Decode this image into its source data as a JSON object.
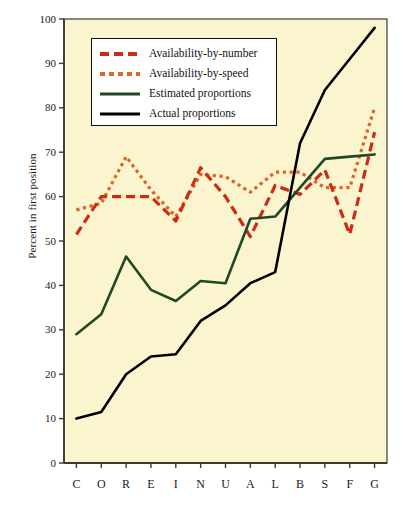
{
  "chart_data": {
    "type": "line",
    "title": "",
    "subtitle": "",
    "xlabel": "",
    "ylabel": "Percent in first position",
    "ylim": [
      0,
      100
    ],
    "ytick_labels": [
      "100",
      "90",
      "80",
      "70",
      "60",
      "50",
      "40",
      "30",
      "20",
      "10",
      "0"
    ],
    "ytick_values": [
      100,
      90,
      80,
      70,
      60,
      50,
      40,
      30,
      20,
      10,
      0
    ],
    "grid": false,
    "legend_position": "upper-left-inside",
    "categories": [
      "C",
      "O",
      "R",
      "E",
      "I",
      "N",
      "U",
      "A",
      "L",
      "B",
      "S",
      "F",
      "G"
    ],
    "series": [
      {
        "name": "Availability-by-number",
        "color": "#CC2B14",
        "style": "dashed",
        "values": [
          51.5,
          60.0,
          60.0,
          60.0,
          54.5,
          66.5,
          60.0,
          51.0,
          62.5,
          60.5,
          66.0,
          51.5,
          74.5
        ]
      },
      {
        "name": "Availability-by-speed",
        "color": "#E0622A",
        "style": "dotted",
        "values": [
          57.0,
          58.5,
          69.0,
          61.5,
          55.5,
          65.0,
          64.5,
          61.0,
          65.5,
          65.5,
          62.0,
          62.0,
          80.0
        ]
      },
      {
        "name": "Estimated proportions",
        "color": "#1E4828",
        "style": "solid",
        "values": [
          29.0,
          33.5,
          46.5,
          39.0,
          36.5,
          41.0,
          40.5,
          55.0,
          55.5,
          62.0,
          68.5,
          69.0,
          69.5
        ]
      },
      {
        "name": "Actual proportions",
        "color": "#000000",
        "style": "solid",
        "values": [
          10.0,
          11.5,
          20.0,
          24.0,
          24.5,
          32.0,
          35.5,
          40.5,
          43.0,
          72.0,
          84.0,
          91.0,
          98.0
        ]
      }
    ]
  },
  "figure": {
    "background_color": "#FAF5CE",
    "page_background_color": "#FFFFFF",
    "axis_color": "#3A3A35"
  },
  "legend": {
    "items": [
      {
        "label": "Availability-by-number"
      },
      {
        "label": "Availability-by-speed"
      },
      {
        "label": "Estimated proportions"
      },
      {
        "label": "Actual proportions"
      }
    ]
  }
}
